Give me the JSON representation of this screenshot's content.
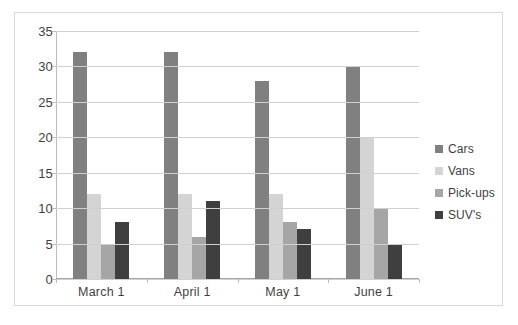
{
  "chart_data": {
    "type": "bar",
    "title": "",
    "subtitle": "",
    "xlabel": "",
    "ylabel": "",
    "categories": [
      "March 1",
      "April 1",
      "May 1",
      "June 1"
    ],
    "series": [
      {
        "name": "Cars",
        "color": "#808080",
        "values": [
          32,
          32,
          28,
          30
        ]
      },
      {
        "name": "Vans",
        "color": "#d4d4d4",
        "values": [
          12,
          12,
          12,
          20
        ]
      },
      {
        "name": "Pick-ups",
        "color": "#a6a6a6",
        "values": [
          5,
          6,
          8,
          10
        ]
      },
      {
        "name": "SUV's",
        "color": "#3f3f3f",
        "values": [
          8,
          11,
          7,
          5
        ]
      }
    ],
    "ylim": [
      0,
      35
    ],
    "ytick_step": 5,
    "yticks": [
      0,
      5,
      10,
      15,
      20,
      25,
      30,
      35
    ],
    "grid": true,
    "legend_position": "right",
    "annotations": []
  },
  "legend": {
    "items": [
      {
        "label": "Cars"
      },
      {
        "label": "Vans"
      },
      {
        "label": "Pick-ups"
      },
      {
        "label": "SUV's"
      }
    ]
  }
}
